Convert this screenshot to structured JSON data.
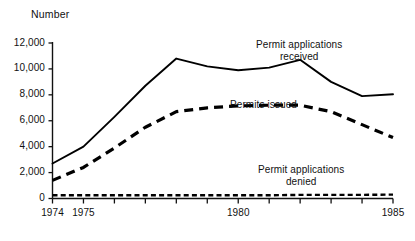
{
  "chart_data": {
    "type": "line",
    "title": "",
    "xlabel": "",
    "ylabel": "Number",
    "ylim": [
      0,
      12000
    ],
    "xlim": [
      1974,
      1985
    ],
    "grid": false,
    "legend_position": "inline-annotations",
    "y_ticks": [
      "0",
      "2,000",
      "4,000",
      "6,000",
      "8,000",
      "10,000",
      "12,000"
    ],
    "y_tick_values": [
      0,
      2000,
      4000,
      6000,
      8000,
      10000,
      12000
    ],
    "x_ticks": [
      "1974",
      "1975",
      "1980",
      "1985"
    ],
    "x_tick_values": [
      1974,
      1975,
      1980,
      1985
    ],
    "x_all_tick_values": [
      1974,
      1975,
      1976,
      1977,
      1978,
      1979,
      1980,
      1981,
      1982,
      1983,
      1984,
      1985
    ],
    "x": [
      1974,
      1975,
      1976,
      1977,
      1978,
      1979,
      1980,
      1981,
      1982,
      1983,
      1984,
      1985
    ],
    "series": [
      {
        "name": "Permit applications received",
        "style": "solid",
        "color": "#000000",
        "values": [
          2700,
          4000,
          6300,
          8700,
          10800,
          10200,
          9900,
          10100,
          10700,
          9000,
          7900,
          8050
        ]
      },
      {
        "name": "Permits issued",
        "style": "dashed",
        "color": "#000000",
        "values": [
          1400,
          2400,
          3900,
          5500,
          6700,
          7000,
          7150,
          7200,
          7200,
          6700,
          5700,
          4700
        ]
      },
      {
        "name": "Permit applications denied",
        "style": "dotted",
        "color": "#000000",
        "values": [
          250,
          250,
          250,
          250,
          250,
          250,
          250,
          250,
          280,
          280,
          280,
          300
        ]
      }
    ],
    "annotations": [
      {
        "id": "received",
        "line1": "Permit applications",
        "line2": "received"
      },
      {
        "id": "issued",
        "line1": "Permits issued",
        "line2": ""
      },
      {
        "id": "denied",
        "line1": "Permit applications",
        "line2": "denied"
      }
    ]
  }
}
